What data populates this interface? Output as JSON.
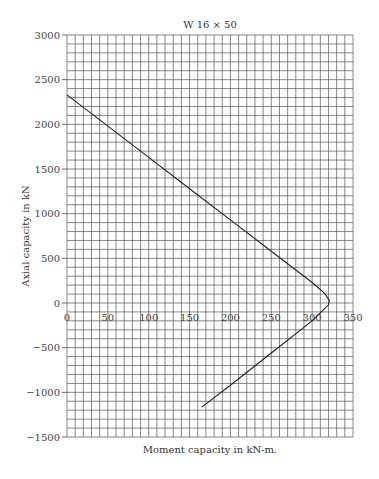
{
  "chart_data": {
    "type": "line",
    "title": "W 16 × 50",
    "xlabel": "Moment capacity in kN-m.",
    "ylabel": "Axial capacity in kN",
    "xlim": [
      0,
      350
    ],
    "ylim": [
      -1500,
      3000
    ],
    "x_ticks": [
      0,
      50,
      100,
      150,
      200,
      250,
      300,
      350
    ],
    "y_ticks": [
      3000,
      2500,
      2000,
      1500,
      1000,
      500,
      0,
      -500,
      -1000,
      -1500
    ],
    "grid": true,
    "grid_minor_x": 10,
    "grid_minor_y": 100,
    "legend": null,
    "series": [
      {
        "name": "Interaction curve",
        "x": [
          0,
          50,
          100,
          150,
          200,
          250,
          300,
          315,
          321,
          320,
          310,
          300,
          250,
          200,
          165
        ],
        "y": [
          2330,
          1980,
          1630,
          1280,
          930,
          580,
          230,
          110,
          33,
          -20,
          -110,
          -200,
          -560,
          -920,
          -1165
        ]
      }
    ]
  },
  "plot": {
    "left": 67,
    "top": 35,
    "right": 353,
    "bottom": 437,
    "line_color": "#222222",
    "grid_color": "#555555"
  }
}
